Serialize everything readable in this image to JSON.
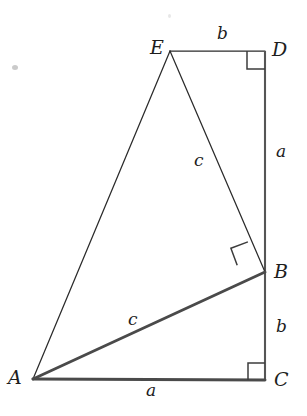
{
  "figure": {
    "background_color": "#ffffff",
    "ink_color": "#2b2b2b",
    "width": 307,
    "height": 416
  },
  "vertices": [
    {
      "id": "E",
      "label": "E",
      "x": 170,
      "y": 51,
      "label_x": 150,
      "label_y": 38
    },
    {
      "id": "D",
      "label": "D",
      "x": 265,
      "y": 51,
      "label_x": 272,
      "label_y": 40
    },
    {
      "id": "B",
      "label": "B",
      "x": 265,
      "y": 272,
      "label_x": 274,
      "label_y": 262
    },
    {
      "id": "C",
      "label": "C",
      "x": 265,
      "y": 380,
      "label_x": 274,
      "label_y": 370
    },
    {
      "id": "A",
      "label": "A",
      "x": 33,
      "y": 379,
      "label_x": 8,
      "label_y": 368
    }
  ],
  "edges": [
    {
      "id": "ED",
      "from": "E",
      "to": "D",
      "weight": "thin"
    },
    {
      "id": "DB",
      "from": "D",
      "to": "B",
      "weight": "vertical"
    },
    {
      "id": "BC",
      "from": "B",
      "to": "C",
      "weight": "vertical"
    },
    {
      "id": "EB",
      "from": "E",
      "to": "B",
      "weight": "thin"
    },
    {
      "id": "AE",
      "from": "A",
      "to": "E",
      "weight": "thin"
    },
    {
      "id": "AB",
      "from": "A",
      "to": "B",
      "weight": "thick"
    },
    {
      "id": "AC",
      "from": "A",
      "to": "C",
      "weight": "thick"
    }
  ],
  "side_labels": [
    {
      "id": "ED",
      "text": "b",
      "x": 217,
      "y": 25
    },
    {
      "id": "DB",
      "text": "a",
      "x": 276,
      "y": 143
    },
    {
      "id": "EB",
      "text": "c",
      "x": 194,
      "y": 152
    },
    {
      "id": "AB",
      "text": "c",
      "x": 128,
      "y": 311
    },
    {
      "id": "BC",
      "text": "b",
      "x": 276,
      "y": 318
    },
    {
      "id": "AC",
      "text": "a",
      "x": 146,
      "y": 382
    }
  ],
  "right_angle_marks": [
    {
      "id": "at-D",
      "vertex": "D",
      "size": 18,
      "rotation_deg": 0
    },
    {
      "id": "at-B",
      "vertex": "B",
      "size": 19,
      "rotation_deg": 26
    },
    {
      "id": "at-C",
      "vertex": "C",
      "size": 17,
      "rotation_deg": 0
    }
  ],
  "scan_artifacts": [
    {
      "id": "speck-left",
      "x": 12,
      "y": 65,
      "w": 6,
      "h": 5
    },
    {
      "id": "speck-top",
      "x": 168,
      "y": 14,
      "w": 3,
      "h": 4
    }
  ]
}
